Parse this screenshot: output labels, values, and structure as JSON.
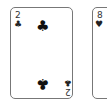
{
  "cards": [
    {
      "rank": "2",
      "suit": "clubs",
      "suit_glyph": "♣"
    },
    {
      "rank": "8",
      "suit": "hearts",
      "suit_glyph": "♥"
    }
  ]
}
